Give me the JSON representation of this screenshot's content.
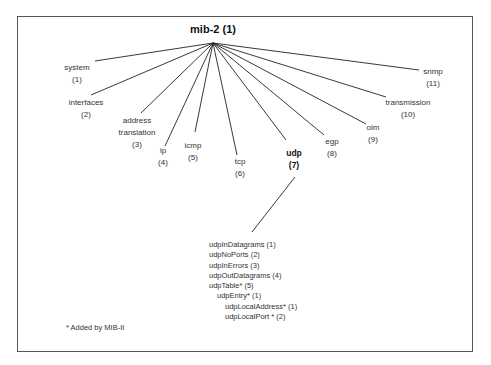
{
  "root": {
    "label": "mib-2 (1)",
    "x": 213,
    "y": 43
  },
  "children": [
    {
      "name": "system",
      "num": "(1)",
      "end": [
        95,
        61
      ],
      "pos": [
        77,
        62
      ],
      "lines": [
        "system",
        "(1)"
      ]
    },
    {
      "name": "interfaces",
      "num": "(2)",
      "end": [
        91,
        95
      ],
      "pos": [
        86,
        97
      ],
      "lines": [
        "interfaces",
        "(2)"
      ]
    },
    {
      "name": "address translation",
      "num": "(3)",
      "end": [
        141,
        113
      ],
      "pos": [
        137,
        115
      ],
      "lines": [
        "address",
        "translation",
        "(3)"
      ]
    },
    {
      "name": "ip",
      "num": "(4)",
      "end": [
        165,
        146
      ],
      "pos": [
        163,
        145
      ],
      "lines": [
        "ip",
        "(4)"
      ]
    },
    {
      "name": "icmp",
      "num": "(5)",
      "end": [
        195,
        132
      ],
      "pos": [
        193,
        140
      ],
      "lines": [
        "icmp",
        "(5)"
      ]
    },
    {
      "name": "tcp",
      "num": "(6)",
      "end": [
        237,
        155
      ],
      "pos": [
        240,
        156
      ],
      "lines": [
        "tcp",
        "(6)"
      ]
    },
    {
      "name": "udp",
      "num": "(7)",
      "end": [
        286,
        140
      ],
      "pos": [
        294,
        147
      ],
      "lines": [
        "udp",
        "(7)"
      ],
      "bold": true
    },
    {
      "name": "egp",
      "num": "(8)",
      "end": [
        324,
        135
      ],
      "pos": [
        332,
        136
      ],
      "lines": [
        "egp",
        "(8)"
      ]
    },
    {
      "name": "oim",
      "num": "(9)",
      "end": [
        366,
        124
      ],
      "pos": [
        373,
        122
      ],
      "lines": [
        "oim",
        "(9)"
      ]
    },
    {
      "name": "transmission",
      "num": "(10)",
      "end": [
        386,
        97
      ],
      "pos": [
        408,
        97
      ],
      "lines": [
        "transmission",
        "(10)"
      ]
    },
    {
      "name": "snmp",
      "num": "(11)",
      "end": [
        419,
        70
      ],
      "pos": [
        433,
        66
      ],
      "lines": [
        "snmp",
        "(11)"
      ]
    }
  ],
  "udp_link": {
    "from": [
      295,
      177
    ],
    "to": [
      252,
      232
    ]
  },
  "udp_group": {
    "items": [
      {
        "label": "udpInDatagrams (1)",
        "indent": 0
      },
      {
        "label": "udpNoPorts (2)",
        "indent": 0
      },
      {
        "label": "udpInErrors (3)",
        "indent": 0
      },
      {
        "label": "udpOutDatagrams (4)",
        "indent": 0
      },
      {
        "label": "udpTable* (5)",
        "indent": 0
      },
      {
        "label": "udpEntry* (1)",
        "indent": 1
      },
      {
        "label": "udpLocalAddress* (1)",
        "indent": 2
      },
      {
        "label": "udpLocalPort * (2)",
        "indent": 2
      }
    ]
  },
  "footnote": "* Added by MIB-II"
}
